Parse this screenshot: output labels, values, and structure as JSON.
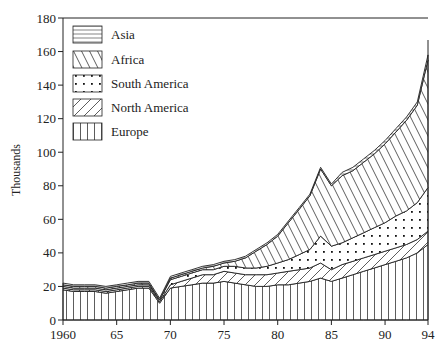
{
  "chart_data": {
    "type": "area",
    "stacked": true,
    "title": "",
    "xlabel": "",
    "ylabel": "Thousands",
    "xlim": [
      1960,
      1994
    ],
    "ylim": [
      0,
      180
    ],
    "grid": false,
    "legend_position": "top-left",
    "x_ticks": [
      1960,
      1965,
      1970,
      1975,
      1980,
      1985,
      1990,
      1994
    ],
    "x_tick_labels": [
      "1960",
      "65",
      "70",
      "75",
      "80",
      "85",
      "90",
      "94"
    ],
    "y_ticks": [
      0,
      20,
      40,
      60,
      80,
      100,
      120,
      140,
      160,
      180
    ],
    "y_tick_labels": [
      "0",
      "20",
      "40",
      "60",
      "80",
      "100",
      "120",
      "140",
      "160",
      "180"
    ],
    "x": [
      1960,
      1961,
      1962,
      1963,
      1964,
      1965,
      1966,
      1967,
      1968,
      1969,
      1970,
      1971,
      1972,
      1973,
      1974,
      1975,
      1976,
      1977,
      1978,
      1979,
      1980,
      1981,
      1982,
      1983,
      1984,
      1985,
      1986,
      1987,
      1988,
      1989,
      1990,
      1991,
      1992,
      1993,
      1994
    ],
    "series": [
      {
        "name": "Europe",
        "pattern": "vertical",
        "values": [
          18,
          17,
          17,
          17,
          16,
          17,
          18,
          19,
          19,
          10,
          19,
          20,
          21,
          22,
          22,
          23,
          22,
          21,
          20,
          20,
          21,
          21,
          22,
          23,
          25,
          23,
          25,
          27,
          29,
          31,
          33,
          35,
          37,
          40,
          45
        ]
      },
      {
        "name": "North America",
        "pattern": "diagonal-up",
        "values": [
          1,
          1,
          1,
          1,
          1,
          1,
          1,
          1,
          1,
          1,
          2,
          3,
          4,
          5,
          5,
          6,
          6,
          6,
          7,
          7,
          7,
          8,
          8,
          8,
          9,
          7,
          8,
          8,
          8,
          8,
          8,
          8,
          8,
          8,
          8
        ]
      },
      {
        "name": "South America",
        "pattern": "dots",
        "values": [
          1,
          1,
          1,
          1,
          1,
          1,
          1,
          1,
          1,
          1,
          3,
          3,
          3,
          3,
          3,
          3,
          4,
          4,
          4,
          5,
          6,
          7,
          9,
          11,
          16,
          14,
          13,
          14,
          15,
          16,
          17,
          19,
          20,
          22,
          26
        ]
      },
      {
        "name": "Africa",
        "pattern": "diagonal-down",
        "values": [
          1,
          1,
          1,
          1,
          1,
          1,
          1,
          1,
          1,
          0,
          1,
          1,
          1,
          1,
          2,
          2,
          3,
          6,
          10,
          13,
          16,
          22,
          27,
          32,
          40,
          36,
          40,
          40,
          42,
          44,
          47,
          50,
          54,
          58,
          76
        ]
      },
      {
        "name": "Asia",
        "pattern": "horizontal",
        "values": [
          1,
          1,
          1,
          1,
          1,
          1,
          1,
          1,
          1,
          1,
          1,
          1,
          1,
          1,
          1,
          1,
          1,
          1,
          1,
          1,
          1,
          1,
          1,
          1,
          1,
          1,
          2,
          2,
          2,
          2,
          2,
          2,
          2,
          2,
          3
        ]
      }
    ],
    "legend_order": [
      "Asia",
      "Africa",
      "South America",
      "North America",
      "Europe"
    ]
  }
}
